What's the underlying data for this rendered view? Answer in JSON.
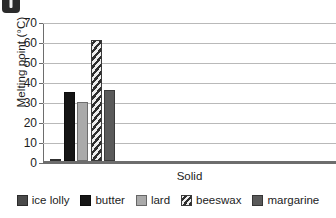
{
  "badge": {
    "icon": "exclamation-badge",
    "color": "#2b2b2b"
  },
  "chart_data": {
    "type": "bar",
    "title": "",
    "xlabel": "Solid",
    "ylabel": "Melting point (°C)",
    "categories": [
      "Solid"
    ],
    "ylim": [
      0,
      70
    ],
    "yticks": [
      0,
      10,
      20,
      30,
      40,
      50,
      60,
      70
    ],
    "ytick_labels": [
      "0",
      "10",
      "20",
      "30",
      "40",
      "50",
      "60",
      "70"
    ],
    "grid": true,
    "legend_position": "bottom",
    "series": [
      {
        "name": "ice lolly",
        "values": [
          1
        ],
        "color": "#4a4a4a",
        "fill": "solid"
      },
      {
        "name": "butter",
        "values": [
          35
        ],
        "color": "#151515",
        "fill": "solid"
      },
      {
        "name": "lard",
        "values": [
          30
        ],
        "color": "#aaaaaa",
        "fill": "solid"
      },
      {
        "name": "beeswax",
        "values": [
          61.5
        ],
        "color": "#2e2e2e",
        "fill": "diagonal-hatch"
      },
      {
        "name": "margarine",
        "values": [
          36
        ],
        "color": "#5a5a5a",
        "fill": "solid"
      }
    ]
  }
}
